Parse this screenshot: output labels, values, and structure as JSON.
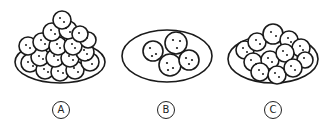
{
  "figure": {
    "options": [
      {
        "id": "A",
        "label": "A",
        "cookie_count": 22,
        "arrangement": "heaped pile"
      },
      {
        "id": "B",
        "label": "B",
        "cookie_count": 4,
        "arrangement": "few cookies on plate"
      },
      {
        "id": "C",
        "label": "C",
        "cookie_count": 14,
        "arrangement": "single layer with some overlap"
      }
    ],
    "colors": {
      "stroke": "#1a1a1a",
      "fill": "#ffffff"
    }
  }
}
